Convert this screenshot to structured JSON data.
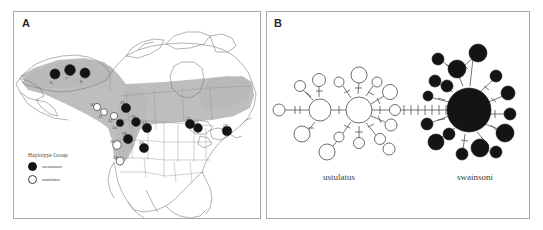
{
  "figure": {
    "panels": [
      {
        "id": "A",
        "label": "A",
        "type": "distribution-map"
      },
      {
        "id": "B",
        "label": "B",
        "type": "haplotype-network"
      }
    ]
  },
  "panel_a": {
    "label": "A",
    "legend": {
      "title": "Haplotype Group",
      "entries": [
        {
          "symbol": "filled-circle",
          "label": "swainsoni",
          "color": "#141414"
        },
        {
          "symbol": "open-circle",
          "label": "ustulatus",
          "color": "#ffffff"
        }
      ]
    },
    "map": {
      "region": "North America",
      "range_shading_color": "#b3b3b3",
      "coastline_color": "#6e6e6e",
      "site_labels": [
        "6",
        "7",
        "8",
        "9",
        "10",
        "11",
        "12",
        "13",
        "14",
        "15",
        "16",
        "17",
        "18",
        "19",
        "20",
        "21",
        "22",
        "23",
        "24"
      ],
      "sites": [
        {
          "label": "6",
          "x": 41,
          "y": 62,
          "group": "swainsoni"
        },
        {
          "label": "7",
          "x": 56,
          "y": 58,
          "group": "swainsoni"
        },
        {
          "label": "8",
          "x": 71,
          "y": 61,
          "group": "swainsoni"
        },
        {
          "label": "10",
          "x": 83,
          "y": 95,
          "group": "ustulatus"
        },
        {
          "label": "11",
          "x": 90,
          "y": 100,
          "group": "swainsoni"
        },
        {
          "label": "12",
          "x": 100,
          "y": 104,
          "group": "swainsoni"
        },
        {
          "label": "13",
          "x": 112,
          "y": 96,
          "group": "swainsoni"
        },
        {
          "label": "14",
          "x": 106,
          "y": 111,
          "group": "ustulatus"
        },
        {
          "label": "16",
          "x": 122,
          "y": 110,
          "group": "swainsoni"
        },
        {
          "label": "17",
          "x": 133,
          "y": 116,
          "group": "swainsoni"
        },
        {
          "label": "18",
          "x": 114,
          "y": 127,
          "group": "swainsoni"
        },
        {
          "label": "19",
          "x": 130,
          "y": 136,
          "group": "swainsoni"
        },
        {
          "label": "20",
          "x": 103,
          "y": 133,
          "group": "ustulatus"
        },
        {
          "label": "15",
          "x": 106,
          "y": 149,
          "group": "ustulatus"
        },
        {
          "label": "21",
          "x": 176,
          "y": 112,
          "group": "swainsoni"
        },
        {
          "label": "22",
          "x": 184,
          "y": 116,
          "group": "swainsoni"
        },
        {
          "label": "23",
          "x": 213,
          "y": 119,
          "group": "swainsoni"
        }
      ]
    }
  },
  "panel_b": {
    "label": "B",
    "taxa": [
      {
        "name": "ustulatus",
        "fill": "#ffffff",
        "stroke": "#4a4a4a"
      },
      {
        "name": "swainsoni",
        "fill": "#141414",
        "stroke": "#141414"
      }
    ],
    "network": {
      "type": "haplotype-network",
      "connecting_branch_tick_count": 7,
      "clusters": [
        {
          "name": "ustulatus",
          "hub_count": 2,
          "satellite_count": 14,
          "fill": "open"
        },
        {
          "name": "swainsoni",
          "hub_count": 1,
          "satellite_count": 17,
          "fill": "filled"
        }
      ]
    }
  }
}
